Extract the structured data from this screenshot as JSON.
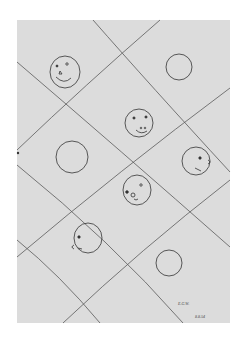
{
  "artwork": {
    "description": "Pencil drawing of circles and faces in a diagonal grid",
    "paper_color": "#dcdcdc",
    "line_color": "#555555",
    "signature": "E.G.W.",
    "date": "8.8.54"
  }
}
